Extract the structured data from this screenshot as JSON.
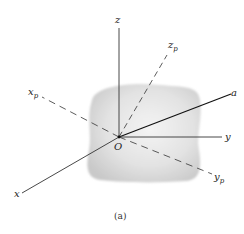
{
  "figure": {
    "caption": "(a)",
    "origin_label": "O",
    "body": {
      "description": "shaded rigid body",
      "color": "#d9d9d9"
    },
    "axes": [
      {
        "id": "z",
        "label": "z",
        "style": "solid"
      },
      {
        "id": "y",
        "label": "y",
        "style": "solid"
      },
      {
        "id": "x",
        "label": "x",
        "style": "solid"
      },
      {
        "id": "a",
        "label": "a",
        "style": "solid"
      },
      {
        "id": "zp",
        "label": "z",
        "subscript": "p",
        "style": "dashed"
      },
      {
        "id": "xp",
        "label": "x",
        "subscript": "p",
        "style": "dashed"
      },
      {
        "id": "yp",
        "label": "y",
        "subscript": "p",
        "style": "dashed"
      }
    ]
  },
  "labels": {
    "z": "z",
    "y": "y",
    "x": "x",
    "a": "a",
    "zp_main": "z",
    "zp_sub": "p",
    "xp_main": "x",
    "xp_sub": "p",
    "yp_main": "y",
    "yp_sub": "p",
    "origin": "O",
    "caption": "(a)"
  }
}
